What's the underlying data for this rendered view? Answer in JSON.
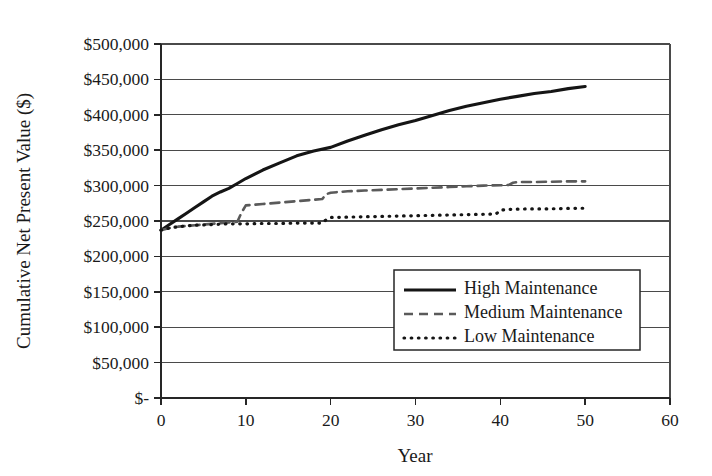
{
  "chart_data": {
    "type": "line",
    "title": "",
    "xlabel": "Year",
    "ylabel": "Cumulative Net Present Value ($)",
    "xlim": [
      0,
      60
    ],
    "ylim": [
      0,
      500000
    ],
    "grid": true,
    "legend_position": "center-right-inside",
    "x_ticks": [
      0,
      10,
      20,
      30,
      40,
      50,
      60
    ],
    "x_tick_labels": [
      "0",
      "10",
      "20",
      "30",
      "40",
      "50",
      "60"
    ],
    "y_ticks": [
      0,
      50000,
      100000,
      150000,
      200000,
      250000,
      300000,
      350000,
      400000,
      450000,
      500000
    ],
    "y_tick_labels": [
      "$-",
      "$50,000",
      "$100,000",
      "$150,000",
      "$200,000",
      "$250,000",
      "$300,000",
      "$350,000",
      "$400,000",
      "$450,000",
      "$500,000"
    ],
    "series": [
      {
        "name": "High Maintenance",
        "style": "solid",
        "color": "#151515",
        "x": [
          0,
          1,
          2,
          3,
          4,
          5,
          6,
          7,
          8,
          9,
          10,
          12,
          14,
          16,
          18,
          20,
          22,
          24,
          26,
          28,
          30,
          32,
          34,
          36,
          38,
          40,
          42,
          44,
          46,
          48,
          50
        ],
        "values": [
          237000,
          245000,
          253000,
          261000,
          269000,
          277000,
          285000,
          291000,
          296000,
          303000,
          310000,
          322000,
          332000,
          342000,
          349000,
          354000,
          363000,
          371000,
          379000,
          386000,
          392000,
          399000,
          406000,
          412000,
          417000,
          422000,
          426000,
          430000,
          433000,
          437000,
          440000
        ]
      },
      {
        "name": "Medium Maintenance",
        "style": "dashed",
        "color": "#5a5a5a",
        "x": [
          0,
          1,
          2,
          3,
          4,
          5,
          6,
          7,
          8,
          9,
          9.5,
          10,
          12,
          14,
          16,
          18,
          19,
          19.5,
          20,
          22,
          24,
          26,
          28,
          30,
          32,
          34,
          36,
          38,
          40,
          41,
          41.5,
          42,
          44,
          46,
          48,
          50
        ],
        "values": [
          237000,
          240000,
          242000,
          243000,
          244000,
          245000,
          246000,
          247000,
          248000,
          249000,
          262000,
          272000,
          274000,
          276000,
          278000,
          280000,
          281000,
          288000,
          290000,
          292000,
          293000,
          294000,
          295000,
          296000,
          297000,
          298000,
          299000,
          300000,
          300500,
          301000,
          304000,
          305000,
          305000,
          305500,
          306000,
          306000
        ]
      },
      {
        "name": "Low Maintenance",
        "style": "dotted",
        "color": "#151515",
        "x": [
          0,
          1,
          2,
          3,
          4,
          5,
          6,
          7,
          8,
          10,
          12,
          14,
          16,
          18,
          19,
          19.5,
          20,
          22,
          24,
          26,
          28,
          30,
          32,
          34,
          36,
          38,
          39.5,
          40,
          40.5,
          41,
          43,
          45,
          47,
          49,
          50
        ],
        "values": [
          237000,
          240000,
          242000,
          243000,
          244000,
          244500,
          245000,
          245500,
          246000,
          246000,
          246500,
          246500,
          247000,
          247000,
          247000,
          252000,
          255000,
          255500,
          256000,
          256500,
          257000,
          257500,
          258000,
          258500,
          259000,
          259500,
          260000,
          265000,
          266000,
          266500,
          267000,
          267000,
          267500,
          268000,
          268000
        ]
      }
    ]
  },
  "legend": {
    "entries": [
      {
        "label": "High Maintenance",
        "style": "solid"
      },
      {
        "label": "Medium Maintenance",
        "style": "dashed"
      },
      {
        "label": "Low Maintenance",
        "style": "dotted"
      }
    ]
  }
}
